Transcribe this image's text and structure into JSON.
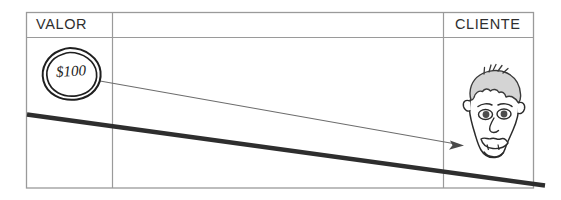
{
  "diagram": {
    "columns": [
      {
        "id": "valor",
        "header": "VALOR"
      },
      {
        "id": "middle",
        "header": ""
      },
      {
        "id": "cliente",
        "header": "CLIENTE"
      }
    ],
    "coin": {
      "name": "coin-circle",
      "amount": "$100",
      "shape": "hand-drawn-circle"
    },
    "person": {
      "name": "customer-face",
      "description": "hand-drawn cartoon face with gray hair"
    },
    "arrow": {
      "name": "value-flow-arrow",
      "from": "coin-circle",
      "to": "customer-face",
      "style": "thin-line-with-arrowhead"
    },
    "trendline": {
      "name": "declining-thick-line",
      "style": "thick-diagonal",
      "direction": "down-right"
    },
    "colors": {
      "background": "#ffffff",
      "grid": "#9a9a9a",
      "ink": "#1a1a1a",
      "thick_line": "#2b2b2b",
      "arrow": "#5a5a5a",
      "hair": "#d4d4d4",
      "text": "#2f2f2f"
    }
  }
}
